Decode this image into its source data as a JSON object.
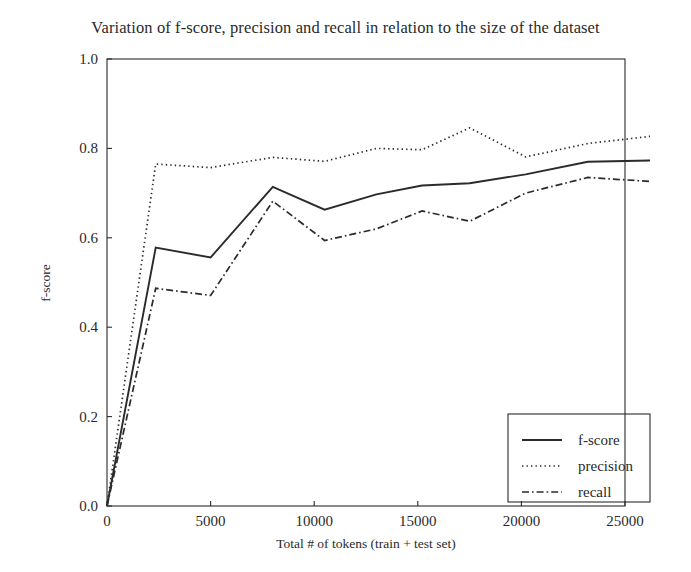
{
  "chart_data": {
    "type": "line",
    "title": "Variation of f-score, precision and recall in relation to the size of the dataset",
    "xlabel": "Total # of tokens (train + test set)",
    "ylabel": "f-score",
    "xlim": [
      0,
      26200
    ],
    "ylim": [
      0.0,
      1.0
    ],
    "grid": false,
    "legend_position": "lower right",
    "xticks": [
      0,
      5000,
      10000,
      15000,
      20000,
      25000
    ],
    "xtick_labels": [
      "0",
      "5000",
      "10000",
      "15000",
      "20000",
      "25000"
    ],
    "yticks": [
      0.0,
      0.2,
      0.4,
      0.6,
      0.8,
      1.0
    ],
    "ytick_labels": [
      "0.0",
      "0.2",
      "0.4",
      "0.6",
      "0.8",
      "1.0"
    ],
    "x": [
      0,
      2350,
      5000,
      8000,
      10500,
      13000,
      15200,
      17500,
      20200,
      23200,
      26200
    ],
    "series": [
      {
        "name": "f-score",
        "style": "solid",
        "color": "#2b2b2b",
        "values": [
          0.0,
          0.578,
          0.556,
          0.714,
          0.663,
          0.697,
          0.717,
          0.722,
          0.742,
          0.77,
          0.773
        ]
      },
      {
        "name": "precision",
        "style": "dotted",
        "color": "#2b2b2b",
        "values": [
          0.0,
          0.765,
          0.757,
          0.78,
          0.771,
          0.8,
          0.797,
          0.846,
          0.781,
          0.811,
          0.827
        ]
      },
      {
        "name": "recall",
        "style": "dashdot",
        "color": "#2b2b2b",
        "values": [
          0.0,
          0.487,
          0.471,
          0.682,
          0.594,
          0.62,
          0.66,
          0.637,
          0.7,
          0.735,
          0.726
        ]
      }
    ]
  },
  "legend": {
    "entries": [
      {
        "label": "f-score",
        "style": "solid"
      },
      {
        "label": "precision",
        "style": "dotted"
      },
      {
        "label": "recall",
        "style": "dashdot"
      }
    ]
  }
}
